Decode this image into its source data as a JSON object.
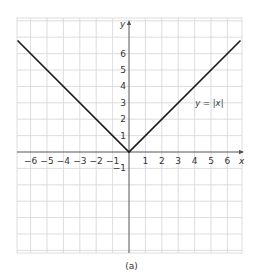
{
  "chart_data": {
    "type": "line",
    "title": "",
    "caption": "(a)",
    "xlabel": "x",
    "ylabel": "y",
    "series": [
      {
        "name": "y = |x|",
        "label": "y = |x|",
        "x": [
          -6.8,
          0,
          6.8
        ],
        "y": [
          6.8,
          0,
          6.8
        ],
        "color": "#1a1a1a"
      }
    ],
    "x_ticks": [
      -6,
      -5,
      -4,
      -3,
      -2,
      -1,
      1,
      2,
      3,
      4,
      5,
      6
    ],
    "x_tick_labels": [
      "−6",
      "−5",
      "−4",
      "−3",
      "−2",
      "−1",
      "1",
      "2",
      "3",
      "4",
      "5",
      "6"
    ],
    "y_ticks": [
      -1,
      1,
      2,
      3,
      4,
      5,
      6
    ],
    "y_tick_labels": [
      "−1",
      "1",
      "2",
      "3",
      "4",
      "5",
      "6"
    ],
    "xlim": [
      -6.8,
      6.9
    ],
    "ylim": [
      -6.2,
      8.1
    ],
    "grid": true,
    "legend_position": "none",
    "annotations": [
      {
        "text": "y = |x|",
        "x": 4.9,
        "y": 3
      }
    ],
    "colors": {
      "grid": "#d4d4d4",
      "axis": "#555555",
      "line": "#1a1a1a",
      "text": "#333333"
    }
  }
}
